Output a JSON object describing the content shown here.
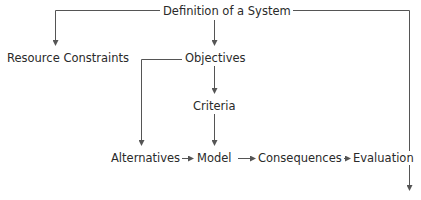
{
  "diagram": {
    "type": "flowchart",
    "line_color": "#555555",
    "text_color": "#2a2a2a",
    "nodes": {
      "definition": "Definition of a System",
      "resource_constraints": "Resource Constraints",
      "objectives": "Objectives",
      "criteria": "Criteria",
      "alternatives": "Alternatives",
      "model": "Model",
      "consequences": "Consequences",
      "evaluation": "Evaluation"
    },
    "edges": [
      {
        "from": "Definition of a System",
        "to": "Resource Constraints"
      },
      {
        "from": "Definition of a System",
        "to": "Objectives"
      },
      {
        "from": "Definition of a System",
        "to": "(off-diagram, bottom right)"
      },
      {
        "from": "Objectives",
        "to": "Criteria"
      },
      {
        "from": "Objectives",
        "to": "Alternatives"
      },
      {
        "from": "Criteria",
        "to": "Model"
      },
      {
        "from": "Alternatives",
        "to": "Model"
      },
      {
        "from": "Model",
        "to": "Consequences"
      },
      {
        "from": "Consequences",
        "to": "Evaluation"
      }
    ]
  }
}
